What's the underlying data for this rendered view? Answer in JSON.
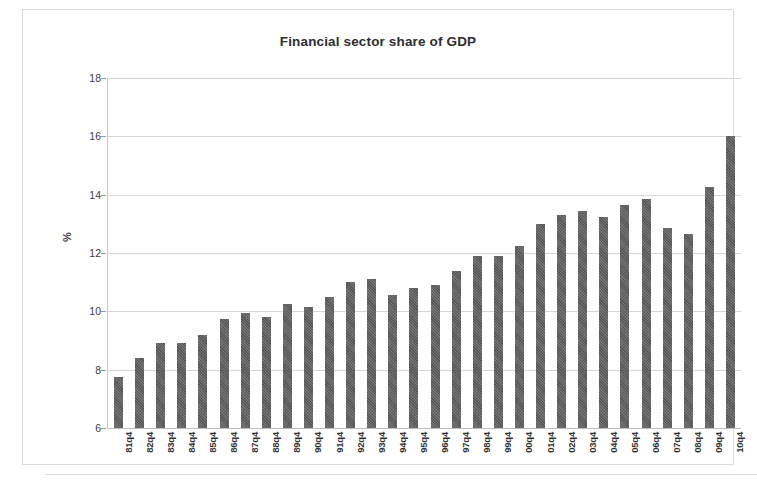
{
  "chart_data": {
    "type": "bar",
    "title": "Financial sector share of GDP",
    "xlabel": "",
    "ylabel": "%",
    "ylim": [
      6,
      18
    ],
    "ytick_values": [
      6,
      8,
      10,
      12,
      14,
      16,
      18
    ],
    "ytick_labels": [
      "6",
      "8",
      "10",
      "12",
      "14",
      "16",
      "18"
    ],
    "grid": true,
    "legend": "none",
    "categories": [
      "81q4",
      "82q4",
      "83q4",
      "84q4",
      "85q4",
      "86q4",
      "87q4",
      "88q4",
      "89q4",
      "90q4",
      "91q4",
      "92q4",
      "93q4",
      "94q4",
      "95q4",
      "96q4",
      "97q4",
      "98q4",
      "99q4",
      "00q4",
      "01q4",
      "02q4",
      "03q4",
      "04q4",
      "05q4",
      "06q4",
      "07q4",
      "08q4",
      "09q4",
      "10q4"
    ],
    "values": [
      7.75,
      8.4,
      8.9,
      8.9,
      9.2,
      9.75,
      9.95,
      9.8,
      10.25,
      10.15,
      10.5,
      11.0,
      11.1,
      10.55,
      10.8,
      10.9,
      11.4,
      11.9,
      11.9,
      12.25,
      13.0,
      13.3,
      13.45,
      13.25,
      13.65,
      13.85,
      12.85,
      12.65,
      14.25,
      16.0
    ],
    "bar_color": "#5d5d5d",
    "grid_color": "#d6d6d6",
    "background_color": "#ffffff"
  }
}
